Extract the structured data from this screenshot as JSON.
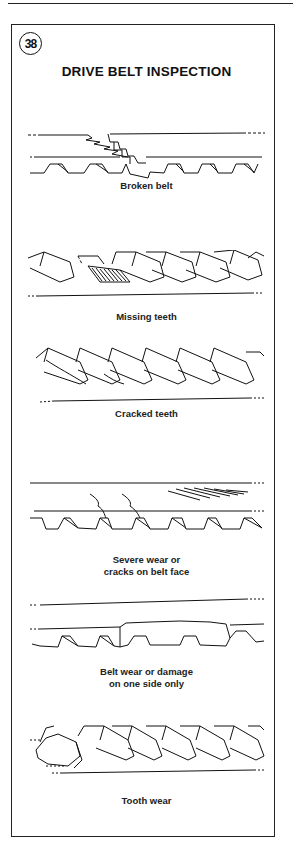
{
  "figure": {
    "number": "38",
    "title": "DRIVE BELT INSPECTION"
  },
  "panels": [
    {
      "id": "broken-belt",
      "caption": [
        "Broken belt"
      ]
    },
    {
      "id": "missing-teeth",
      "caption": [
        "Missing teeth"
      ]
    },
    {
      "id": "cracked-teeth",
      "caption": [
        "Cracked teeth"
      ]
    },
    {
      "id": "severe-wear",
      "caption": [
        "Severe wear or",
        "cracks on belt face"
      ]
    },
    {
      "id": "side-wear",
      "caption": [
        "Belt wear or damage",
        "on one side only"
      ]
    },
    {
      "id": "tooth-wear",
      "caption": [
        "Tooth wear"
      ]
    }
  ]
}
